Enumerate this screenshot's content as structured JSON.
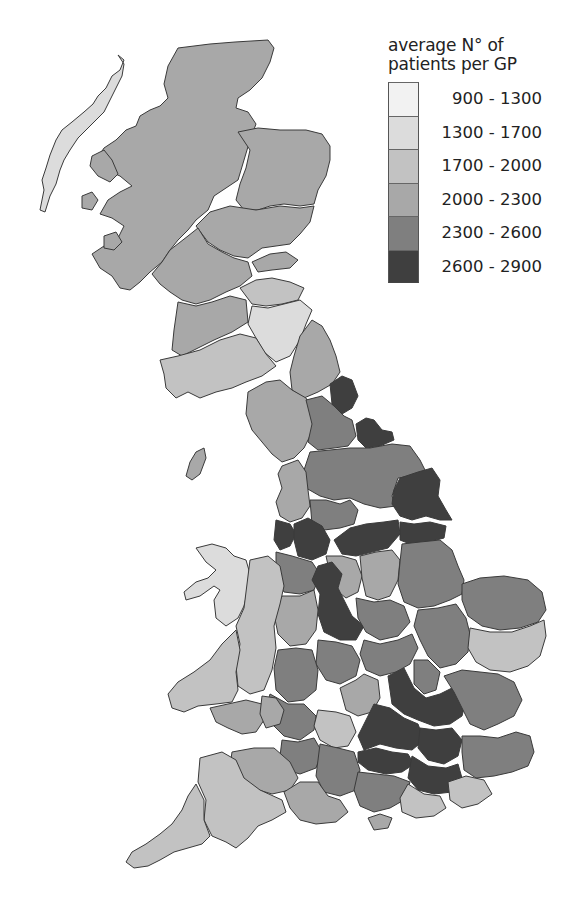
{
  "legend": {
    "title_line1": "average N° of",
    "title_line2": "patients per GP",
    "items": [
      {
        "label": "900 - 1300",
        "color": "#f2f2f2"
      },
      {
        "label": "1300 - 1700",
        "color": "#dcdcdc"
      },
      {
        "label": "1700 - 2000",
        "color": "#c2c2c2"
      },
      {
        "label": "2000 - 2300",
        "color": "#a8a8a8"
      },
      {
        "label": "2300 - 2600",
        "color": "#7f7f7f"
      },
      {
        "label": "2600 - 2900",
        "color": "#3f3f3f"
      }
    ]
  },
  "map": {
    "subject": "Great Britain health regions",
    "regions": [
      {
        "name": "outer-hebrides",
        "category": 1
      },
      {
        "name": "highland",
        "category": 3
      },
      {
        "name": "grampian",
        "category": 3
      },
      {
        "name": "tayside",
        "category": 3
      },
      {
        "name": "fife",
        "category": 3
      },
      {
        "name": "lothian",
        "category": 2
      },
      {
        "name": "greater-glasgow",
        "category": 3
      },
      {
        "name": "lanarkshire",
        "category": 2
      },
      {
        "name": "borders",
        "category": 1
      },
      {
        "name": "ayrshire",
        "category": 3
      },
      {
        "name": "dumfries-galloway",
        "category": 2
      },
      {
        "name": "northumberland",
        "category": 3
      },
      {
        "name": "cumbria",
        "category": 3
      },
      {
        "name": "tyneside",
        "category": 5
      },
      {
        "name": "durham",
        "category": 4
      },
      {
        "name": "teesside",
        "category": 5
      },
      {
        "name": "north-yorkshire",
        "category": 4
      },
      {
        "name": "east-riding",
        "category": 5
      },
      {
        "name": "lancashire",
        "category": 3
      },
      {
        "name": "west-yorkshire",
        "category": 4
      },
      {
        "name": "merseyside",
        "category": 5
      },
      {
        "name": "greater-manchester",
        "category": 5
      },
      {
        "name": "south-yorkshire",
        "category": 5
      },
      {
        "name": "north-lincolnshire",
        "category": 5
      },
      {
        "name": "lincolnshire",
        "category": 4
      },
      {
        "name": "cheshire",
        "category": 4
      },
      {
        "name": "derbyshire",
        "category": 3
      },
      {
        "name": "nottinghamshire",
        "category": 3
      },
      {
        "name": "staffordshire",
        "category": 5
      },
      {
        "name": "shropshire",
        "category": 3
      },
      {
        "name": "leicestershire",
        "category": 4
      },
      {
        "name": "norfolk",
        "category": 4
      },
      {
        "name": "cambridgeshire",
        "category": 4
      },
      {
        "name": "suffolk",
        "category": 2
      },
      {
        "name": "west-midlands",
        "category": 4
      },
      {
        "name": "northamptonshire",
        "category": 4
      },
      {
        "name": "herefordshire-worcestershire",
        "category": 4
      },
      {
        "name": "warwickshire",
        "category": 3
      },
      {
        "name": "bedfordshire",
        "category": 4
      },
      {
        "name": "hertfordshire",
        "category": 5
      },
      {
        "name": "essex",
        "category": 4
      },
      {
        "name": "oxfordshire",
        "category": 2
      },
      {
        "name": "buckinghamshire",
        "category": 5
      },
      {
        "name": "gloucestershire",
        "category": 4
      },
      {
        "name": "berkshire",
        "category": 5
      },
      {
        "name": "london",
        "category": 5
      },
      {
        "name": "surrey",
        "category": 5
      },
      {
        "name": "kent",
        "category": 4
      },
      {
        "name": "north-wales",
        "category": 1
      },
      {
        "name": "powys",
        "category": 2
      },
      {
        "name": "dyfed",
        "category": 2
      },
      {
        "name": "gwent",
        "category": 3
      },
      {
        "name": "glamorgan",
        "category": 3
      },
      {
        "name": "avon",
        "category": 4
      },
      {
        "name": "wiltshire",
        "category": 4
      },
      {
        "name": "hampshire",
        "category": 4
      },
      {
        "name": "somerset",
        "category": 3
      },
      {
        "name": "dorset",
        "category": 3
      },
      {
        "name": "devon",
        "category": 2
      },
      {
        "name": "cornwall",
        "category": 2
      },
      {
        "name": "west-sussex",
        "category": 2
      },
      {
        "name": "east-sussex",
        "category": 2
      },
      {
        "name": "isle-of-wight",
        "category": 3
      },
      {
        "name": "isle-of-man",
        "category": 3
      },
      {
        "name": "skye-mull-islands",
        "category": 3
      }
    ]
  }
}
